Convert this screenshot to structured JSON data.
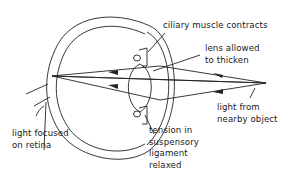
{
  "labels": {
    "ciliary": {
      "line1": "ciliary muscle contracts"
    },
    "lens": {
      "line1": "lens allowed",
      "line2": "to thicken"
    },
    "light_from": {
      "line1": "light from",
      "line2": "nearby object"
    },
    "tension": {
      "line1": "tension in",
      "line2": "suspensory",
      "line3": "ligament",
      "line4": "relaxed"
    },
    "focused": {
      "line1": "light focused",
      "line2": "on retina"
    }
  },
  "colors": {
    "stroke": "#222222",
    "background": "#ffffff"
  }
}
